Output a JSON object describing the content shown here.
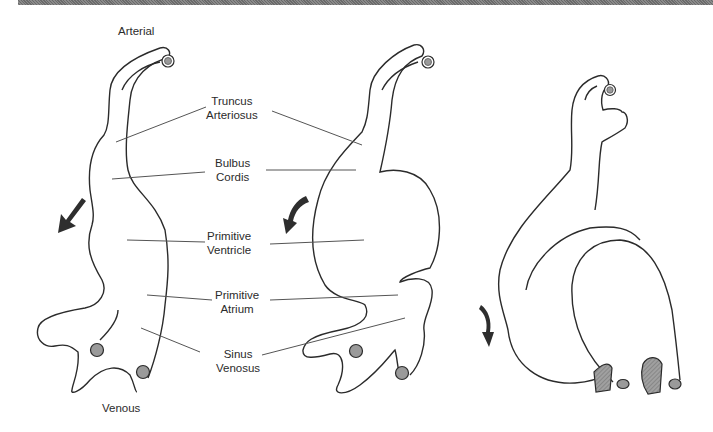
{
  "figure": {
    "top_label": "Arterial",
    "bottom_label": "Venous",
    "structures": [
      {
        "line1": "Truncus",
        "line2": "Arteriosus"
      },
      {
        "line1": "Bulbus",
        "line2": "Cordis"
      },
      {
        "line1": "Primitive",
        "line2": "Ventricle"
      },
      {
        "line1": "Primitive",
        "line2": "Atrium"
      },
      {
        "line1": "Sinus",
        "line2": "Venosus"
      }
    ],
    "stages": [
      "straight-heart-tube",
      "looping-heart-tube",
      "folded-heart"
    ],
    "colors": {
      "outline": "#2b2b2b",
      "vessel_fill": "#9a9a9a",
      "shaded_vessel": "#8c8c8c",
      "arrow": "#2e2e2e",
      "leader_line": "#555555"
    }
  }
}
